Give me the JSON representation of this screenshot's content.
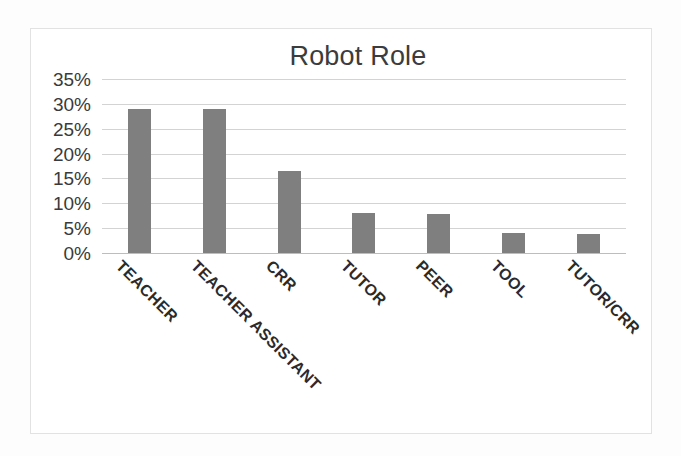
{
  "chart_data": {
    "type": "bar",
    "title": "Robot Role",
    "xlabel": "",
    "ylabel": "",
    "categories": [
      "TEACHER",
      "TEACHER ASSISTANT",
      "CRR",
      "TUTOR",
      "PEER",
      "TOOL",
      "TUTOR/CRR"
    ],
    "values": [
      29,
      29,
      16.5,
      8,
      7.8,
      4,
      3.8
    ],
    "value_labels": [
      "29%",
      "29%",
      "16.5%",
      "8%",
      "7.8%",
      "4%",
      "3.8%"
    ],
    "ylim": [
      0,
      35
    ],
    "y_tick_values": [
      35,
      30,
      25,
      20,
      15,
      10,
      5,
      0
    ],
    "y_tick_labels": [
      "35%",
      "30%",
      "25%",
      "20%",
      "15%",
      "10%",
      "5%",
      "0%"
    ],
    "grid": true,
    "legend": false,
    "legend_position": "none",
    "bar_color": "#7f7f7f",
    "gridline_color": "#d3d3d3",
    "title_color": "#3c3c3c",
    "label_rotation_degrees": 45
  },
  "frame": {
    "border_color": "#e2e2e2",
    "background_color": "#ffffff"
  }
}
